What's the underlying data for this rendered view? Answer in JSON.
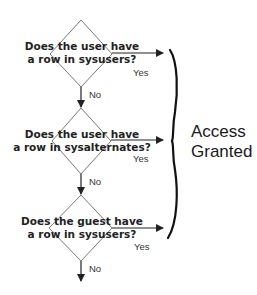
{
  "diagram": {
    "decisions": [
      {
        "line1": "Does the user have",
        "line2": "a row in sysusers?",
        "yes_label": "Yes",
        "no_label": "No"
      },
      {
        "line1": "Does the user have",
        "line2": "a row in sysalternates?",
        "yes_label": "Yes",
        "no_label": "No"
      },
      {
        "line1": "Does the guest have",
        "line2": "a row in sysusers?",
        "yes_label": "Yes",
        "no_label": "No"
      }
    ],
    "outcome": {
      "line1": "Access",
      "line2": "Granted"
    }
  }
}
